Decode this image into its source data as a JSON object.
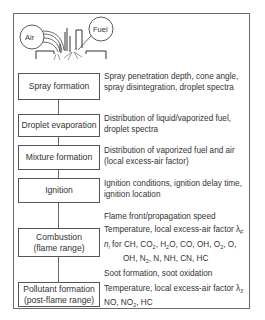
{
  "illustration": {
    "air_label": "Air",
    "fuel_label": "Fuel"
  },
  "stages": [
    {
      "label_lines": [
        "Spray formation"
      ],
      "description_lines": [
        "Spray penetration depth, cone angle,",
        "spray disintegration, droplet spectra"
      ]
    },
    {
      "label_lines": [
        "Droplet evaporation"
      ],
      "description_lines": [
        "Distribution of liquid/vaporized fuel,",
        "droplet spectra"
      ]
    },
    {
      "label_lines": [
        "Mixture formation"
      ],
      "description_lines": [
        "Distribution of vaporized fuel and air",
        "(local excess-air factor)"
      ]
    },
    {
      "label_lines": [
        "Ignition"
      ],
      "description_lines": [
        "Ignition conditions, ignition delay time,",
        "ignition location"
      ]
    },
    {
      "label_lines": [
        "Combustion",
        "(flame range)"
      ],
      "description_pre": "Flame front/propagation speed",
      "description_lines": [
        "Temperature, local excess-air factor λ",
        "for CH, CO",
        "OH, N",
        "Soot formation, soot oxidation"
      ],
      "lambda_sub": "F",
      "species": {
        "n_symbol": "n",
        "n_sub": "i",
        "line1_parts": [
          "for CH, CO",
          "2",
          ", H",
          "2",
          "O, CO, OH, O",
          "2",
          ", O,"
        ],
        "line2_parts": [
          "OH, N",
          "2",
          ", N, NH, CN, HC"
        ]
      }
    },
    {
      "label_lines": [
        "Pollutant formation",
        "(post-flame range)"
      ],
      "description_lines": [
        "Temperature, local excess-air factor  λ",
        "NO, NO"
      ],
      "lambda_sub": "3",
      "line2_parts": [
        "NO, NO",
        "2",
        ", HC"
      ]
    }
  ]
}
